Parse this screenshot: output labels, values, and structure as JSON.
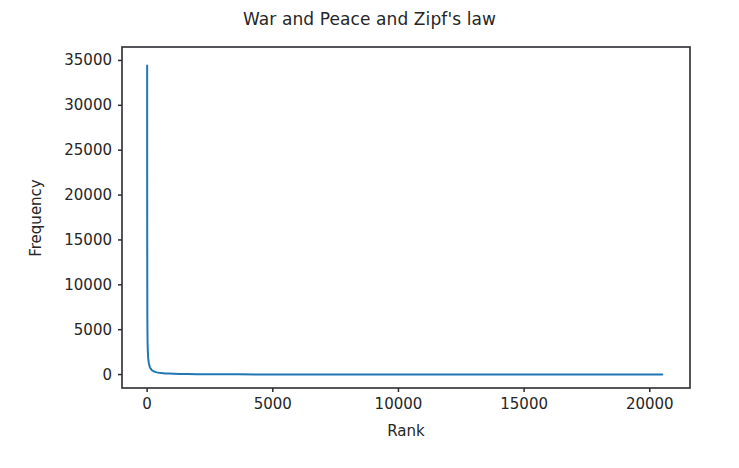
{
  "chart_data": {
    "type": "line",
    "title": "War and Peace and Zipf's law",
    "xlabel": "Rank",
    "ylabel": "Frequency",
    "xlim": [
      -1000,
      21600
    ],
    "ylim": [
      -1500,
      36500
    ],
    "xticks": [
      0,
      5000,
      10000,
      15000,
      20000
    ],
    "xtick_labels": [
      "0",
      "5000",
      "10000",
      "15000",
      "20000"
    ],
    "yticks": [
      0,
      5000,
      10000,
      15000,
      20000,
      25000,
      30000,
      35000
    ],
    "ytick_labels": [
      "0",
      "5000",
      "10000",
      "15000",
      "20000",
      "25000",
      "30000",
      "35000"
    ],
    "grid": false,
    "legend": "none",
    "series": [
      {
        "name": "word frequency",
        "color": "#1f77b4",
        "linewidth": 2.0,
        "x": [
          1,
          2,
          3,
          4,
          5,
          6,
          7,
          8,
          9,
          10,
          12,
          15,
          18,
          22,
          27,
          33,
          40,
          50,
          62,
          76,
          93,
          115,
          140,
          172,
          210,
          258,
          316,
          387,
          474,
          581,
          712,
          872,
          1069,
          1310,
          1605,
          1966,
          2409,
          2951,
          3616,
          4430,
          5000,
          6000,
          7000,
          8000,
          9000,
          10000,
          11000,
          12000,
          13000,
          14000,
          15000,
          16000,
          17000,
          18000,
          19000,
          20000,
          20500
        ],
        "y": [
          34433,
          22071,
          16857,
          14972,
          12670,
          10247,
          9130,
          6950,
          6320,
          5800,
          5020,
          4190,
          3650,
          3100,
          2680,
          2280,
          1950,
          1640,
          1380,
          1150,
          960,
          800,
          660,
          545,
          445,
          365,
          295,
          240,
          195,
          158,
          127,
          102,
          82,
          65,
          52,
          41,
          32,
          25,
          19,
          14,
          12,
          9,
          7,
          6,
          5,
          4,
          4,
          3,
          3,
          2,
          2,
          2,
          2,
          1,
          1,
          1,
          1
        ]
      }
    ],
    "annotations": []
  },
  "figure": {
    "background_color": "#ffffff",
    "axes_color": "#2b2b33",
    "text_color": "#262626"
  }
}
